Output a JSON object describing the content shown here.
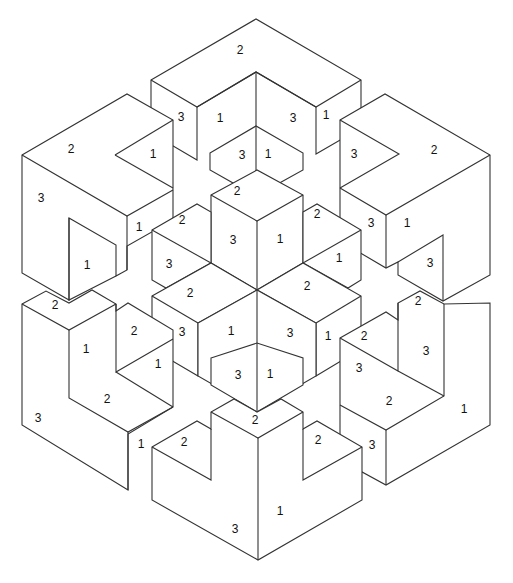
{
  "diagram": {
    "title": "",
    "colors": {
      "stroke": "#333333",
      "fill": "#ffffff",
      "text": "#111111"
    },
    "labels": [
      {
        "id": "t1",
        "text": "2",
        "x": 240,
        "y": 51
      },
      {
        "id": "t2",
        "text": "3",
        "x": 181,
        "y": 118
      },
      {
        "id": "t3",
        "text": "1",
        "x": 220,
        "y": 119
      },
      {
        "id": "t4",
        "text": "3",
        "x": 293,
        "y": 119
      },
      {
        "id": "t5",
        "text": "1",
        "x": 326,
        "y": 116
      },
      {
        "id": "t6",
        "text": "3",
        "x": 242,
        "y": 156
      },
      {
        "id": "t7",
        "text": "1",
        "x": 268,
        "y": 155
      },
      {
        "id": "l1",
        "text": "2",
        "x": 71,
        "y": 150
      },
      {
        "id": "l2",
        "text": "1",
        "x": 153,
        "y": 155
      },
      {
        "id": "l3",
        "text": "3",
        "x": 41,
        "y": 199
      },
      {
        "id": "l4",
        "text": "1",
        "x": 139,
        "y": 228
      },
      {
        "id": "l5",
        "text": "1",
        "x": 87,
        "y": 266
      },
      {
        "id": "r1",
        "text": "2",
        "x": 434,
        "y": 151
      },
      {
        "id": "r2",
        "text": "3",
        "x": 354,
        "y": 155
      },
      {
        "id": "r3",
        "text": "3",
        "x": 371,
        "y": 224
      },
      {
        "id": "r4",
        "text": "1",
        "x": 407,
        "y": 224
      },
      {
        "id": "r5",
        "text": "3",
        "x": 430,
        "y": 264
      },
      {
        "id": "c1",
        "text": "2",
        "x": 237,
        "y": 192
      },
      {
        "id": "c2",
        "text": "2",
        "x": 182,
        "y": 221
      },
      {
        "id": "c3",
        "text": "2",
        "x": 317,
        "y": 215
      },
      {
        "id": "c4",
        "text": "3",
        "x": 233,
        "y": 241
      },
      {
        "id": "c5",
        "text": "1",
        "x": 280,
        "y": 240
      },
      {
        "id": "c6",
        "text": "3",
        "x": 169,
        "y": 265
      },
      {
        "id": "c7",
        "text": "1",
        "x": 339,
        "y": 259
      },
      {
        "id": "c8",
        "text": "2",
        "x": 190,
        "y": 294
      },
      {
        "id": "c9",
        "text": "2",
        "x": 307,
        "y": 287
      },
      {
        "id": "c10",
        "text": "3",
        "x": 182,
        "y": 333
      },
      {
        "id": "c11",
        "text": "1",
        "x": 231,
        "y": 332
      },
      {
        "id": "c12",
        "text": "3",
        "x": 290,
        "y": 334
      },
      {
        "id": "c13",
        "text": "1",
        "x": 328,
        "y": 337
      },
      {
        "id": "c14",
        "text": "3",
        "x": 238,
        "y": 376
      },
      {
        "id": "c15",
        "text": "1",
        "x": 270,
        "y": 375
      },
      {
        "id": "bl1",
        "text": "2",
        "x": 55,
        "y": 306
      },
      {
        "id": "bl2",
        "text": "2",
        "x": 134,
        "y": 332
      },
      {
        "id": "bl3",
        "text": "1",
        "x": 86,
        "y": 350
      },
      {
        "id": "bl4",
        "text": "1",
        "x": 158,
        "y": 365
      },
      {
        "id": "bl5",
        "text": "2",
        "x": 107,
        "y": 400
      },
      {
        "id": "bl6",
        "text": "3",
        "x": 38,
        "y": 419
      },
      {
        "id": "bl7",
        "text": "1",
        "x": 141,
        "y": 445
      },
      {
        "id": "br1",
        "text": "2",
        "x": 418,
        "y": 302
      },
      {
        "id": "br2",
        "text": "2",
        "x": 364,
        "y": 337
      },
      {
        "id": "br3",
        "text": "3",
        "x": 426,
        "y": 352
      },
      {
        "id": "br4",
        "text": "3",
        "x": 359,
        "y": 369
      },
      {
        "id": "br5",
        "text": "2",
        "x": 389,
        "y": 402
      },
      {
        "id": "br6",
        "text": "1",
        "x": 464,
        "y": 410
      },
      {
        "id": "br7",
        "text": "3",
        "x": 372,
        "y": 446
      },
      {
        "id": "b1",
        "text": "2",
        "x": 255,
        "y": 421
      },
      {
        "id": "b2",
        "text": "2",
        "x": 184,
        "y": 443
      },
      {
        "id": "b3",
        "text": "2",
        "x": 318,
        "y": 441
      },
      {
        "id": "b4",
        "text": "1",
        "x": 280,
        "y": 512
      },
      {
        "id": "b5",
        "text": "3",
        "x": 235,
        "y": 530
      }
    ]
  }
}
